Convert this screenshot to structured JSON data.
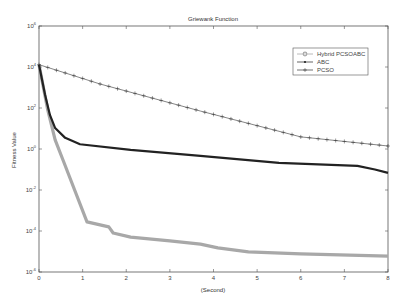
{
  "chart_data": {
    "type": "line",
    "title": "Griewank Function",
    "xlabel": "(Second)",
    "ylabel": "Fitness Value",
    "xlim": [
      0,
      8
    ],
    "ylim": [
      1e-06,
      1000000.0
    ],
    "yscale": "log",
    "x_ticks": [
      "0",
      "1",
      "2",
      "3",
      "4",
      "5",
      "6",
      "7",
      "8"
    ],
    "y_ticks": [
      {
        "base": "10",
        "exp": "6"
      },
      {
        "base": "10",
        "exp": "4"
      },
      {
        "base": "10",
        "exp": "2"
      },
      {
        "base": "10",
        "exp": "0"
      },
      {
        "base": "10",
        "exp": "-2"
      },
      {
        "base": "10",
        "exp": "-4"
      },
      {
        "base": "10",
        "exp": "-6"
      }
    ],
    "grid": false,
    "legend_position": "upper right",
    "series": [
      {
        "name": "Hybrid PCSOABC",
        "color": "#a8a8a8",
        "marker": "circle",
        "x": [
          0,
          0.2,
          0.37,
          0.55,
          1.1,
          1.6,
          1.7,
          2.1,
          3.0,
          3.7,
          4.1,
          4.8,
          6.0,
          8.0
        ],
        "values": [
          13000,
          80,
          2.8,
          0.29,
          0.00028,
          0.00016,
          8e-05,
          5e-05,
          3.3e-05,
          2.3e-05,
          1.5e-05,
          9.5e-06,
          7.6e-06,
          6e-06
        ]
      },
      {
        "name": "ABC",
        "color": "#222222",
        "marker": "star",
        "x": [
          0,
          0.14,
          0.25,
          0.37,
          0.6,
          0.94,
          2.1,
          3.7,
          5.5,
          7.3,
          7.7,
          8.0
        ],
        "values": [
          13000,
          430,
          46,
          10.5,
          3.5,
          1.7,
          0.9,
          0.46,
          0.21,
          0.15,
          0.1,
          0.068
        ]
      },
      {
        "name": "PCSO",
        "color": "#333333",
        "marker": "plus",
        "x": [
          0,
          1.4,
          3.7,
          6.0,
          8.0
        ],
        "values": [
          13000,
          1480,
          71,
          3.9,
          1.4
        ]
      }
    ]
  }
}
